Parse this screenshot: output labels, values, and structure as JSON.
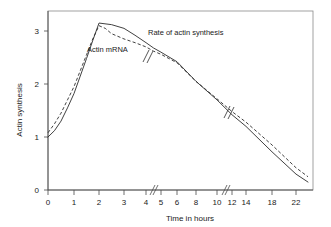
{
  "chart_data": {
    "type": "line",
    "title": "",
    "xlabel": "Time in hours",
    "ylabel": "Actin synthesis",
    "xtick_labels": [
      "0",
      "1",
      "2",
      "3",
      "4",
      "5",
      "6",
      "8",
      "10",
      "12",
      "14",
      "18",
      "22"
    ],
    "ytick_labels": [
      "0",
      "1",
      "2",
      "3"
    ],
    "ylim": [
      0,
      3.6
    ],
    "grid": false,
    "legend": "inline-annotations",
    "axis_breaks": [
      "between 4 and 5",
      "between 10 and 12"
    ],
    "series": [
      {
        "name": "Rate of actin synthesis",
        "style": "solid",
        "x": [
          0,
          0.25,
          0.5,
          0.75,
          1,
          1.25,
          1.5,
          1.75,
          2,
          2.5,
          3,
          3.5,
          4,
          4.5,
          5,
          6,
          8,
          10,
          12,
          14,
          18,
          22,
          24
        ],
        "y": [
          1.0,
          1.12,
          1.3,
          1.55,
          1.82,
          2.15,
          2.48,
          2.82,
          3.15,
          3.12,
          3.05,
          2.92,
          2.78,
          2.68,
          2.6,
          2.42,
          2.05,
          1.7,
          1.42,
          1.2,
          0.72,
          0.3,
          0.15
        ]
      },
      {
        "name": "Actin mRNA",
        "style": "dashed",
        "x": [
          0,
          0.25,
          0.5,
          0.75,
          1,
          1.25,
          1.5,
          1.75,
          2,
          2.25,
          2.5,
          3,
          3.5,
          4,
          4.5,
          5,
          6,
          8,
          10,
          12,
          14,
          18,
          22,
          24
        ],
        "y": [
          1.08,
          1.25,
          1.45,
          1.7,
          1.95,
          2.25,
          2.55,
          2.85,
          3.1,
          3.05,
          2.95,
          2.85,
          2.78,
          2.7,
          2.62,
          2.56,
          2.4,
          2.05,
          1.72,
          1.48,
          1.28,
          0.85,
          0.42,
          0.25
        ]
      }
    ],
    "annotations": [
      {
        "text": "Rate of actin synthesis",
        "x_px": 148,
        "y_px": 35
      },
      {
        "text": "Actin mRNA",
        "x_px": 87,
        "y_px": 52
      }
    ]
  },
  "axes": {
    "x_title": "Time in hours",
    "y_title": "Actin synthesis",
    "x_ticks": [
      {
        "label": "0",
        "px": 48
      },
      {
        "label": "1",
        "px": 74
      },
      {
        "label": "2",
        "px": 99
      },
      {
        "label": "3",
        "px": 124
      },
      {
        "label": "4",
        "px": 146
      },
      {
        "label": "5",
        "px": 161
      },
      {
        "label": "6",
        "px": 177
      },
      {
        "label": "8",
        "px": 196
      },
      {
        "label": "10",
        "px": 217
      },
      {
        "label": "12",
        "px": 232
      },
      {
        "label": "14",
        "px": 246
      },
      {
        "label": "18",
        "px": 272
      },
      {
        "label": "22",
        "px": 296
      }
    ],
    "y_ticks": [
      {
        "label": "0",
        "px": 190
      },
      {
        "label": "1",
        "px": 137
      },
      {
        "label": "2",
        "px": 84
      },
      {
        "label": "3",
        "px": 31
      }
    ]
  },
  "colors": {
    "background": "#ffffff",
    "line": "#2b2b2b",
    "axis": "#4a4a4a",
    "border": "#8a8a8a",
    "text": "#1a1a1a"
  }
}
